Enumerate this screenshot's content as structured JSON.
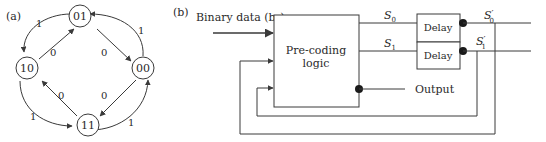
{
  "panel_a": {
    "label": "(a)",
    "states": [
      {
        "id": "01",
        "label": "01",
        "cx": 80,
        "cy": 18
      },
      {
        "id": "00",
        "label": "00",
        "cx": 143,
        "cy": 68
      },
      {
        "id": "11",
        "label": "11",
        "cx": 80,
        "cy": 126
      },
      {
        "id": "10",
        "label": "10",
        "cx": 20,
        "cy": 68
      }
    ],
    "transitions": [
      {
        "from": "01",
        "to": "10",
        "input": "1",
        "style": "outer-arc"
      },
      {
        "from": "10",
        "to": "01",
        "input": "0",
        "style": "inner-line"
      },
      {
        "from": "01",
        "to": "00",
        "input": "0",
        "style": "inner-line"
      },
      {
        "from": "00",
        "to": "01",
        "input": "1",
        "style": "outer-arc"
      },
      {
        "from": "00",
        "to": "11",
        "input": "0",
        "style": "inner-line"
      },
      {
        "from": "11",
        "to": "00",
        "input": "1",
        "style": "outer-arc"
      },
      {
        "from": "11",
        "to": "10",
        "input": "0",
        "style": "inner-line"
      },
      {
        "from": "10",
        "to": "11",
        "input": "1",
        "style": "outer-arc"
      }
    ]
  },
  "panel_b": {
    "label": "(b)",
    "input_label": "Binary data (b",
    "input_subscript": "n",
    "input_close": ")",
    "precoder_line1": "Pre-coding",
    "precoder_line2": "logic",
    "s0": "S",
    "s0_sub": "0",
    "s1": "S",
    "s1_sub": "1",
    "delay_top": "Delay",
    "delay_bottom": "Delay",
    "s0p": "S",
    "s0p_sub": "0",
    "s1p": "S",
    "s1p_sub": "1",
    "prime": "′",
    "output_label": "Output"
  },
  "colors": {
    "line": "#3a3a3a",
    "text": "#2a2a2a",
    "background": "#ffffff"
  }
}
